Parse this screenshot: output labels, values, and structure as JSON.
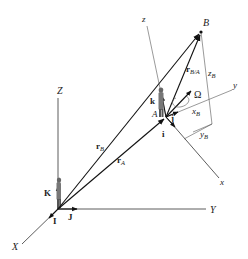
{
  "diagram": {
    "fixed_frame": {
      "axes": {
        "X": "X",
        "Y": "Y",
        "Z": "Z"
      },
      "unit_vectors": {
        "I": "I",
        "J": "J",
        "K": "K"
      }
    },
    "moving_frame": {
      "origin": "A",
      "axes": {
        "x": "x",
        "y": "y",
        "z": "z"
      },
      "unit_vectors": {
        "i": "i",
        "j": "j",
        "k": "k"
      },
      "angular_velocity": "Ω"
    },
    "points": {
      "A": "A",
      "B": "B"
    },
    "vectors": {
      "rA": {
        "main": "r",
        "sub": "A"
      },
      "rB": {
        "main": "r",
        "sub": "B"
      },
      "rBA": {
        "main": "r",
        "sub": "B/A"
      }
    },
    "components": {
      "xB": {
        "main": "x",
        "sub": "B"
      },
      "yB": {
        "main": "y",
        "sub": "B"
      },
      "zB": {
        "main": "z",
        "sub": "B"
      }
    }
  }
}
